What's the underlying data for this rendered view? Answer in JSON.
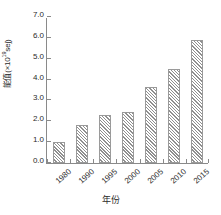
{
  "chart_data": {
    "type": "bar",
    "title": "",
    "subtitle": "",
    "categories": [
      "1980",
      "1990",
      "1995",
      "2000",
      "2005",
      "2010",
      "2015"
    ],
    "values": [
      1.0,
      1.8,
      2.3,
      2.45,
      3.65,
      4.5,
      5.9
    ],
    "series": [
      {
        "name": "",
        "values": [
          1.0,
          1.8,
          2.3,
          2.45,
          3.65,
          4.5,
          5.9
        ]
      }
    ],
    "xlabel": "年份",
    "ylabel": "能值(×10¹⁹sej)",
    "ylabel_text": "能值(×10",
    "ylabel_exponent": "19",
    "ylabel_tail": "sej)",
    "ylim": [
      0.0,
      7.0
    ],
    "ytick_values": [
      0.0,
      1.0,
      2.0,
      3.0,
      4.0,
      5.0,
      6.0,
      7.0
    ],
    "ytick_labels": [
      "0.0",
      "1.0",
      "2.0",
      "3.0",
      "4.0",
      "5.0",
      "6.0",
      "7.0"
    ],
    "grid": false,
    "legend": false,
    "legend_position": "none",
    "bar_fill": "diagonal-hatch",
    "bar_fill_color": "#ffffff",
    "bar_hatch_color": "#8f8f8f",
    "bar_edge_color": "#9a9a9a",
    "axis_color": "#8a8a8a",
    "text_color": "#2b2b2b",
    "background_color": "#ffffff",
    "xtick_label_rotation": -42
  }
}
